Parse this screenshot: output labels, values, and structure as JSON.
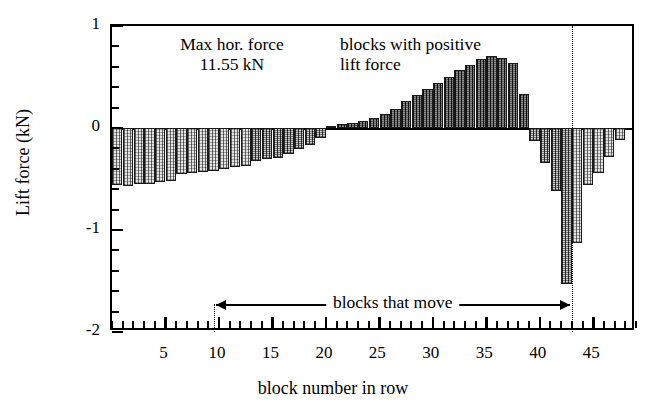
{
  "chart_data": {
    "type": "bar",
    "title": "",
    "xlabel": "block number in row",
    "ylabel": "Lift force (kN)",
    "xlim": [
      0,
      49
    ],
    "ylim": [
      -2,
      1
    ],
    "y_ticks": [
      -2,
      -1,
      0,
      1
    ],
    "y_tick_labels": [
      "-2",
      "-1",
      "0",
      "1"
    ],
    "y_minor_step": 0.2,
    "x_ticks": [
      5,
      10,
      15,
      20,
      25,
      30,
      35,
      40,
      45
    ],
    "x_tick_labels": [
      "5",
      "10",
      "15",
      "20",
      "25",
      "30",
      "35",
      "40",
      "45"
    ],
    "x_minor_step": 1,
    "grid": false,
    "legend": false,
    "bar_width_fraction": 0.96,
    "categories": [
      1,
      2,
      3,
      4,
      5,
      6,
      7,
      8,
      9,
      10,
      11,
      12,
      13,
      14,
      15,
      16,
      17,
      18,
      19,
      20,
      21,
      22,
      23,
      24,
      25,
      26,
      27,
      28,
      29,
      30,
      31,
      32,
      33,
      34,
      35,
      36,
      37,
      38,
      39,
      40,
      41,
      42,
      43,
      44,
      45,
      46,
      47,
      48
    ],
    "values": [
      -0.56,
      -0.57,
      -0.55,
      -0.55,
      -0.53,
      -0.52,
      -0.45,
      -0.44,
      -0.43,
      -0.42,
      -0.4,
      -0.38,
      -0.37,
      -0.32,
      -0.3,
      -0.29,
      -0.25,
      -0.21,
      -0.17,
      -0.1,
      0.02,
      0.04,
      0.05,
      0.07,
      0.1,
      0.14,
      0.19,
      0.26,
      0.32,
      0.38,
      0.44,
      0.5,
      0.57,
      0.62,
      0.68,
      0.71,
      0.69,
      0.64,
      0.33,
      -0.13,
      -0.34,
      -0.62,
      -1.53,
      -1.13,
      -0.56,
      -0.44,
      -0.28,
      -0.12
    ],
    "shading": [
      "light",
      "light",
      "light",
      "light",
      "light",
      "light",
      "light",
      "light",
      "light",
      "light",
      "light",
      "light",
      "light",
      "mid",
      "mid",
      "mid",
      "mid",
      "mid",
      "mid",
      "mid",
      "dark",
      "dark",
      "dark",
      "dark",
      "dark",
      "dark",
      "dark",
      "dark",
      "dark",
      "dark",
      "dark",
      "dark",
      "dark",
      "dark",
      "dark",
      "dark",
      "dark",
      "dark",
      "dark",
      "mid",
      "mid",
      "mid",
      "mid",
      "light",
      "light",
      "light",
      "light",
      "light"
    ]
  },
  "annotations": {
    "max_force": {
      "line1": "Max hor. force",
      "line2": "11.55 kN"
    },
    "positive_block_note": {
      "line1": "blocks with positive",
      "line2": "lift force"
    },
    "blocks_that_move": "blocks that move",
    "marker_lines": {
      "left_block": 9.5,
      "right_block": 43
    }
  },
  "colors": {
    "axis": "#000000",
    "bar_light": "#e3e3e3",
    "bar_mid": "#cfcfcf",
    "bar_dark": "#5c5c5c",
    "background": "#ffffff"
  }
}
